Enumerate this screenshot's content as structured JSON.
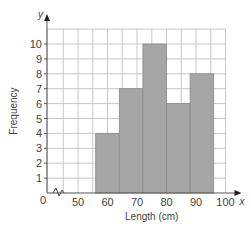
{
  "chart_data": {
    "type": "bar",
    "subtype": "histogram",
    "title": "",
    "xlabel": "Length (cm)",
    "ylabel": "Frequency",
    "x_axis_letter": "x",
    "y_axis_letter": "y",
    "origin_label": "0",
    "bins": [
      {
        "from": 56,
        "to": 64,
        "frequency": 4
      },
      {
        "from": 64,
        "to": 72,
        "frequency": 7
      },
      {
        "from": 72,
        "to": 80,
        "frequency": 10
      },
      {
        "from": 80,
        "to": 88,
        "frequency": 6
      },
      {
        "from": 88,
        "to": 96,
        "frequency": 8
      }
    ],
    "categories": [
      "56-64",
      "64-72",
      "72-80",
      "80-88",
      "88-96"
    ],
    "values": [
      4,
      7,
      10,
      6,
      8
    ],
    "x_ticks": [
      "50",
      "60",
      "70",
      "80",
      "90",
      "100"
    ],
    "y_ticks": [
      "1",
      "2",
      "3",
      "4",
      "5",
      "6",
      "7",
      "8",
      "9",
      "10"
    ],
    "xlim": [
      40,
      100
    ],
    "ylim": [
      0,
      11
    ],
    "grid": true,
    "axis_break": true,
    "bar_color": "#a6a6a6",
    "grid_color": "#c8c8c8"
  }
}
